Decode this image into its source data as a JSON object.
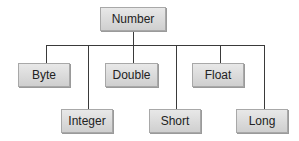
{
  "diagram": {
    "type": "hierarchy",
    "root": {
      "label": "Number"
    },
    "children": [
      {
        "label": "Byte",
        "row": 1
      },
      {
        "label": "Integer",
        "row": 2
      },
      {
        "label": "Double",
        "row": 1
      },
      {
        "label": "Short",
        "row": 2
      },
      {
        "label": "Float",
        "row": 1
      },
      {
        "label": "Long",
        "row": 2
      }
    ]
  }
}
